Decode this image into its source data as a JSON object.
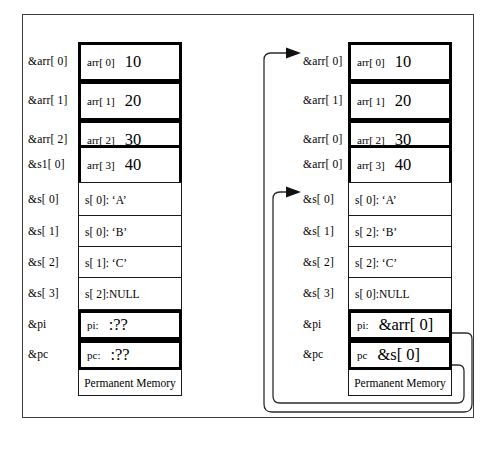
{
  "figure": {
    "footer_label": "Permanent Memory"
  },
  "left_panel": {
    "name": "before-assignment",
    "footer_label": "Permanent Memory",
    "rows": [
      {
        "address": "&arr[ 0]",
        "name": "arr[ 0]",
        "value": "10",
        "style": "thick"
      },
      {
        "address": "&arr[ 1]",
        "name": "arr[ 1]",
        "value": "20",
        "style": "thick"
      },
      {
        "address": "&arr[ 2]",
        "name": "arr[ 2]",
        "value": "30",
        "style": "thick"
      },
      {
        "address": "&s1[ 0]",
        "name": "arr[ 3]",
        "value": "40",
        "style": "thick"
      },
      {
        "address": "&s[ 0]",
        "text": "s[ 0]: ‘A’",
        "style": "thin"
      },
      {
        "address": "&s[ 1]",
        "text": "s[ 0]: ‘B’",
        "style": "thin"
      },
      {
        "address": "&s[ 2]",
        "text": "s[ 1]: ‘C’",
        "style": "thin"
      },
      {
        "address": "&s[ 3]",
        "text": "s[ 2]:NULL",
        "style": "thin"
      },
      {
        "address": "&pi",
        "name": "pi:",
        "value": ":??",
        "style": "thick"
      },
      {
        "address": "&pc",
        "name": "pc:",
        "value": ":??",
        "style": "thick"
      }
    ]
  },
  "right_panel": {
    "name": "after-assignment",
    "footer_label": "Permanent Memory",
    "rows": [
      {
        "address": "&arr[ 0]",
        "name": "arr[ 0]",
        "value": "10",
        "style": "thick",
        "arrow": true
      },
      {
        "address": "&arr[ 1]",
        "name": "arr[ 1]",
        "value": "20",
        "style": "thick",
        "arrow": false
      },
      {
        "address": "&arr[ 0]",
        "name": "arr[ 2]",
        "value": "30",
        "style": "thick",
        "arrow": false
      },
      {
        "address": "&arr[ 0]",
        "name": "arr[ 3]",
        "value": "40",
        "style": "thick",
        "arrow": false
      },
      {
        "address": "&s[ 0]",
        "text": "s[ 0]: ‘A’",
        "style": "thin",
        "arrow": true
      },
      {
        "address": "&s[ 1]",
        "text": "s[ 2]: ‘B’",
        "style": "thin",
        "arrow": false
      },
      {
        "address": "&s[ 2]",
        "text": "s[ 2]: ‘C’",
        "style": "thin",
        "arrow": false
      },
      {
        "address": "&s[ 3]",
        "text": "s[ 0]:NULL",
        "style": "thin",
        "arrow": false
      },
      {
        "address": "&pi",
        "name": "pi:",
        "value": "&arr[ 0]",
        "style": "thick",
        "arrow": false
      },
      {
        "address": "&pc",
        "name": "pc",
        "value": "&s[ 0]",
        "style": "thick",
        "arrow": false
      }
    ],
    "pointers": [
      {
        "from": "pi",
        "to": "&arr[ 0]"
      },
      {
        "from": "pc",
        "to": "&s[ 0]"
      }
    ]
  },
  "colors": {
    "ink": "#000000",
    "frame": "#3a3a3a",
    "wire": "#2b2b2b",
    "paper": "#ffffff"
  }
}
